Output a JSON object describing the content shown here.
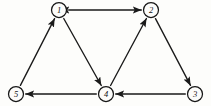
{
  "figure": {
    "background_color": "#fdfdfb",
    "stroke_color": "#1a1a1a",
    "node_fill_color": "#fcfcfa",
    "width": 211,
    "height": 106
  },
  "chart_data": {
    "type": "diagram",
    "diagram_kind": "directed-graph",
    "title": "",
    "nodes": [
      {
        "id": "1",
        "label": "1",
        "x": 59,
        "y": 10,
        "r": 7.5
      },
      {
        "id": "2",
        "label": "2",
        "x": 151,
        "y": 10,
        "r": 7.5
      },
      {
        "id": "3",
        "label": "3",
        "x": 195,
        "y": 94,
        "r": 7.5
      },
      {
        "id": "4",
        "label": "4",
        "x": 106,
        "y": 94,
        "r": 7.5
      },
      {
        "id": "5",
        "label": "5",
        "x": 16,
        "y": 94,
        "r": 7.5
      }
    ],
    "edges": [
      {
        "from": "1",
        "to": "2",
        "directed": "both",
        "label": ""
      },
      {
        "from": "5",
        "to": "1",
        "directed": "forward",
        "label": ""
      },
      {
        "from": "1",
        "to": "4",
        "directed": "forward",
        "label": ""
      },
      {
        "from": "4",
        "to": "2",
        "directed": "forward",
        "label": ""
      },
      {
        "from": "2",
        "to": "3",
        "directed": "forward",
        "label": ""
      },
      {
        "from": "3",
        "to": "4",
        "directed": "forward",
        "label": ""
      },
      {
        "from": "4",
        "to": "5",
        "directed": "forward",
        "label": ""
      }
    ],
    "node_count": 5,
    "edge_count": 7,
    "grid": false,
    "legend": null,
    "xlabel": "",
    "ylabel": ""
  }
}
